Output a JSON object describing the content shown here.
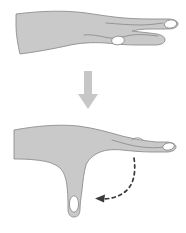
{
  "figure": {
    "width": 186,
    "height": 233,
    "background_color": "#ffffff",
    "caption": "",
    "panels": [
      {
        "id": "panel-top",
        "label": "Hand with fingers extended",
        "description": "Side view of a right hand and forearm, palm down, fingers held straight out.",
        "state": "extended"
      },
      {
        "id": "panel-bottom",
        "label": "Hand with index finger flexed downward",
        "description": "Side view of the same hand with one finger bent fully downward toward the palm.",
        "state": "flexed"
      }
    ],
    "arrows": [
      {
        "id": "transition-arrow",
        "type": "straight",
        "style": "solid",
        "direction": "down",
        "label": "",
        "color": "#c0c0c0"
      },
      {
        "id": "motion-arrow",
        "type": "curved",
        "style": "dashed",
        "direction": "down-left",
        "label": "",
        "color": "#3a3a3a"
      }
    ],
    "colors": {
      "skin_fill": "#c9c9c9",
      "skin_stroke": "#8e8e8e",
      "nail_fill": "#ffffff",
      "nail_stroke": "#8e8e8e",
      "crease_stroke": "#8e8e8e",
      "solid_arrow": "#c0c0c0",
      "dashed_arrow": "#3a3a3a",
      "background": "#ffffff"
    }
  }
}
